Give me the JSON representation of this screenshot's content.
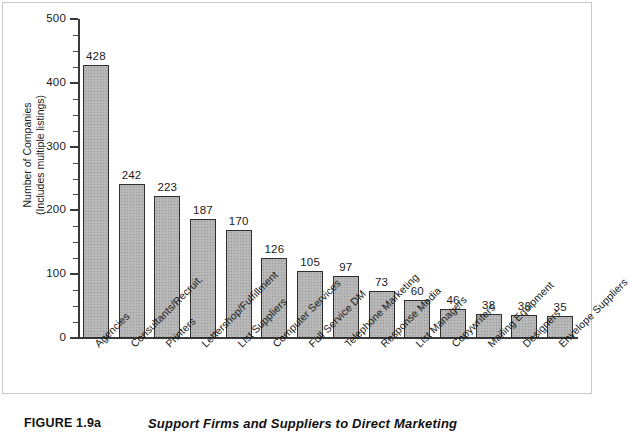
{
  "caption": {
    "figure_number": "FIGURE 1.9a",
    "title": "Support Firms and Suppliers to Direct Marketing"
  },
  "axis": {
    "y_title_line1": "Number of Companies",
    "y_title_line2": "(Includes multiple listings)",
    "y_ticks": [
      "0",
      "100",
      "200",
      "300",
      "400",
      "500"
    ]
  },
  "chart_data": {
    "type": "bar",
    "title": "Support Firms and Suppliers to Direct Marketing",
    "xlabel": "",
    "ylabel": "Number of Companies (Includes multiple listings)",
    "ylim": [
      0,
      500
    ],
    "y_major_tick_interval": 100,
    "y_minor_tick_interval": 25,
    "grid": false,
    "legend": false,
    "bar_color": "#b4b4b4",
    "bar_edge_color": "#2e2e2e",
    "categories": [
      "Agencies",
      "Consultants/Recruit.",
      "Printers",
      "Lettershop/Fulfillment",
      "List Suppliers",
      "Computer Services",
      "Full Service DM",
      "Telephone Marketing",
      "Response Media",
      "List Managers",
      "Copywriters",
      "Mailing Equipment",
      "Designers",
      "Envelope Suppliers"
    ],
    "values": [
      428,
      242,
      223,
      187,
      170,
      126,
      105,
      97,
      73,
      60,
      46,
      38,
      36,
      35
    ]
  }
}
